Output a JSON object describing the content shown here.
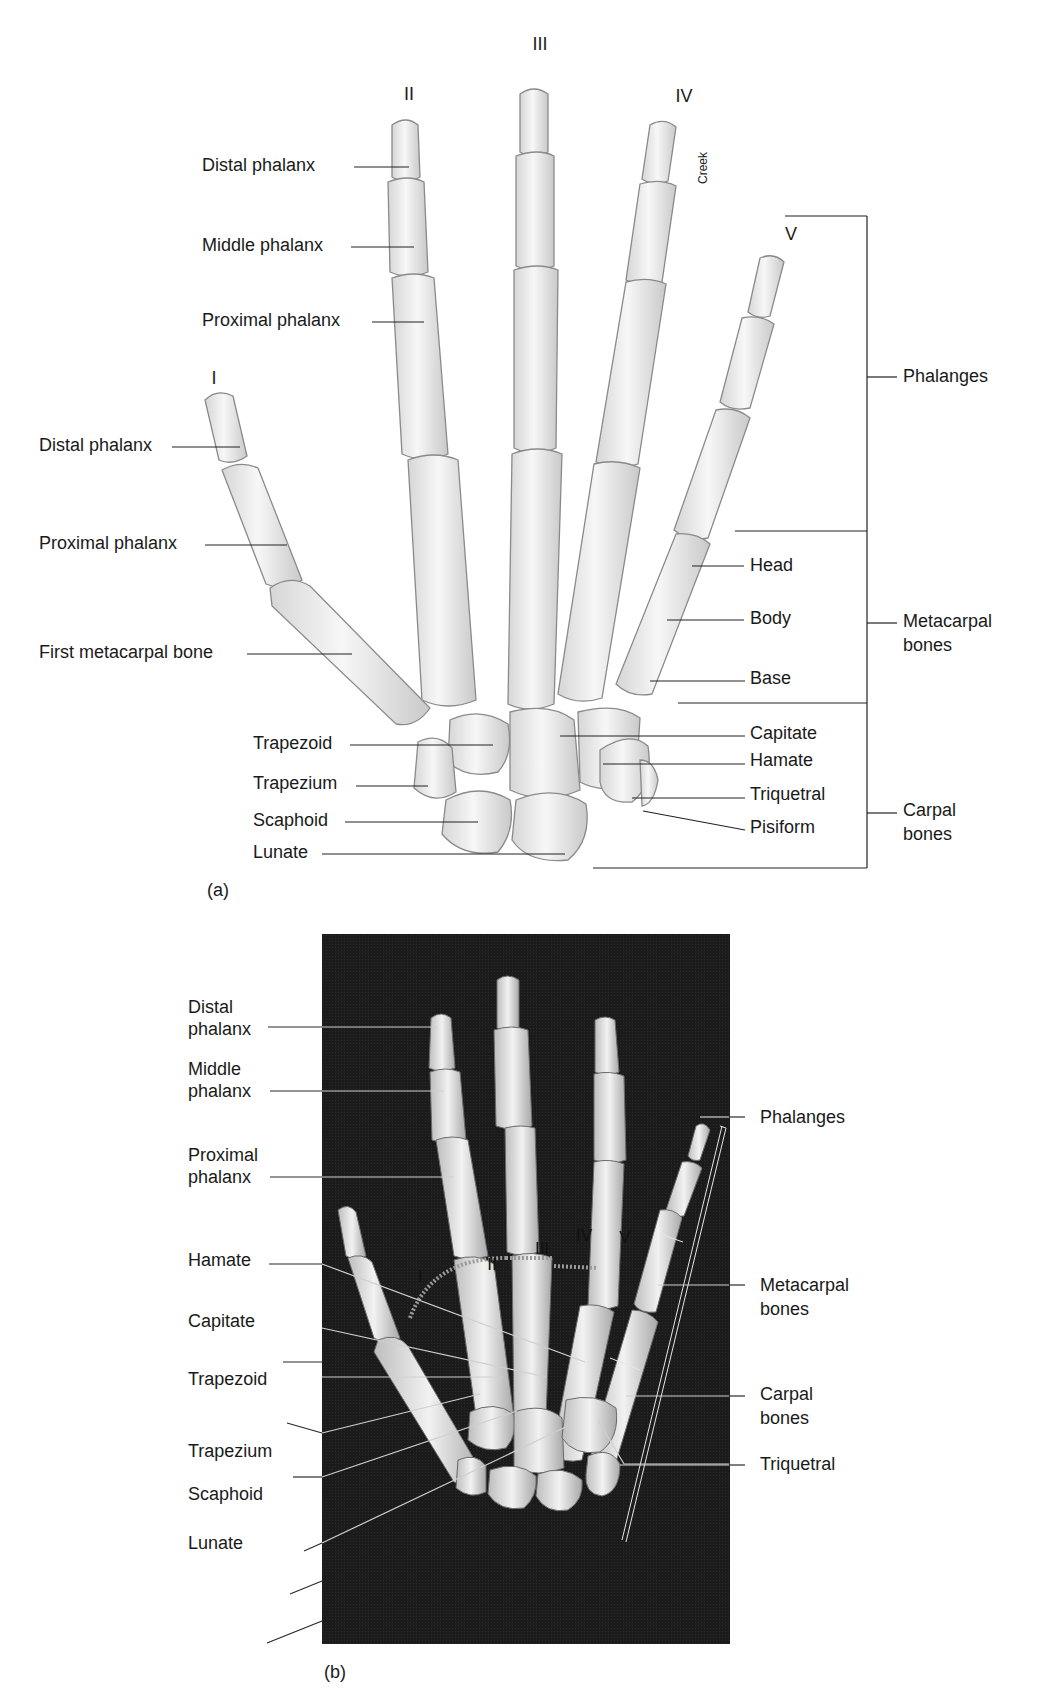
{
  "figure_a": {
    "caption": "(a)",
    "finger_numerals": [
      "I",
      "II",
      "III",
      "IV",
      "V"
    ],
    "artist_credit": "Creek",
    "left_labels": {
      "finger_ii": [
        "Distal phalanx",
        "Middle phalanx",
        "Proximal phalanx"
      ],
      "thumb": [
        "Distal phalanx",
        "Proximal phalanx",
        "First metacarpal bone"
      ],
      "carpals": [
        "Trapezoid",
        "Trapezium",
        "Scaphoid",
        "Lunate"
      ]
    },
    "right_labels": {
      "metacarpal_parts": [
        "Head",
        "Body",
        "Base"
      ],
      "carpals": [
        "Capitate",
        "Hamate",
        "Triquetral",
        "Pisiform"
      ]
    },
    "brackets": {
      "phalanges": "Phalanges",
      "metacarpal_line1": "Metacarpal",
      "metacarpal_line2": "bones",
      "carpal_line1": "Carpal",
      "carpal_line2": "bones"
    }
  },
  "figure_b": {
    "caption": "(b)",
    "finger_numerals": [
      "I",
      "II",
      "III",
      "IV",
      "V"
    ],
    "left_labels": {
      "distal_line1": "Distal",
      "distal_line2": "phalanx",
      "middle_line1": "Middle",
      "middle_line2": "phalanx",
      "proximal_line1": "Proximal",
      "proximal_line2": "phalanx",
      "carpals": [
        "Hamate",
        "Capitate",
        "Trapezoid",
        "Trapezium",
        "Scaphoid",
        "Lunate"
      ]
    },
    "right_labels": {
      "phalanges": "Phalanges",
      "metacarpal_line1": "Metacarpal",
      "metacarpal_line2": "bones",
      "carpal_line1": "Carpal",
      "carpal_line2": "bones",
      "triquetral": "Triquetral"
    }
  }
}
